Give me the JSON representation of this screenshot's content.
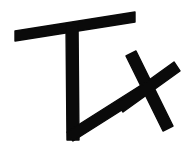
{
  "image": {
    "kind": "handwritten-glyph",
    "label": "Tx",
    "description": "Black hand-drawn mark resembling the letters T and x on a plain white background",
    "width": 188,
    "height": 154,
    "background_color": "#ffffff",
    "ink_color": "#0a0a0a",
    "alt_text": "Tx"
  },
  "strokes": [
    {
      "name": "t-crossbar",
      "label": "T crossbar",
      "role": "horizontal top bar of the letter T, slanted slightly upward to the right",
      "color": "#0a0a0a",
      "points": "15,31 135,12 135,22 15,41",
      "width_px": 10
    },
    {
      "name": "t-stem",
      "label": "T stem",
      "role": "vertical descending stroke of the letter T",
      "color": "#0a0a0a",
      "points": "66,25 78,23 79,140 67,140",
      "width_px": 11
    },
    {
      "name": "t-foot-diagonal",
      "label": "T foot diagonal",
      "role": "long diagonal rising from the foot of the stem toward the x",
      "color": "#0a0a0a",
      "points": "67,132 146,82 152,91 73,141",
      "width_px": 10
    },
    {
      "name": "x-stroke-down-right",
      "label": "x stroke, upper-left to lower-right",
      "role": "first crossing stroke of the letter x",
      "color": "#0a0a0a",
      "points": "126,56 136,51 173,126 163,131",
      "width_px": 11
    },
    {
      "name": "x-stroke-up-right",
      "label": "x stroke, lower-left to upper-right",
      "role": "second crossing stroke of the letter x",
      "color": "#0a0a0a",
      "points": "117,103 174,62 180,71 123,112",
      "width_px": 11
    }
  ]
}
